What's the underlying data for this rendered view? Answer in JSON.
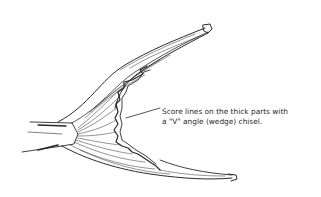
{
  "figure": {
    "annotation": {
      "line1": "Score lines on the thick parts with",
      "line2": "a \"V\" angle (wedge) chisel."
    },
    "colors": {
      "ink": "#2a2a2a",
      "background": "#ffffff"
    }
  }
}
